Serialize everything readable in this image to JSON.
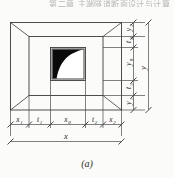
{
  "page": {
    "running_header": "第二章 主端隧道断面设计与计算",
    "background_color": "#fbfbfa",
    "line_color": "#3a3a3a"
  },
  "figure": {
    "caption": "(a)",
    "type": "engineering-dimension-drawing",
    "shading_color": "#0a0a0a",
    "horizontal_dimensions": {
      "overall_label": "x",
      "segments": [
        {
          "label": "x",
          "sub": "1"
        },
        {
          "label": "t",
          "sub": "1"
        },
        {
          "label": "x",
          "sub": "0"
        },
        {
          "label": "t",
          "sub": "2"
        },
        {
          "label": "x",
          "sub": "2"
        }
      ]
    },
    "vertical_dimensions": {
      "overall_label": "y",
      "segments": [
        {
          "label": "y",
          "sub": "2"
        },
        {
          "label": "t",
          "sub": "4"
        },
        {
          "label": "y",
          "sub": "0"
        },
        {
          "label": "t",
          "sub": "3"
        },
        {
          "label": "y",
          "sub": "1"
        }
      ]
    }
  }
}
